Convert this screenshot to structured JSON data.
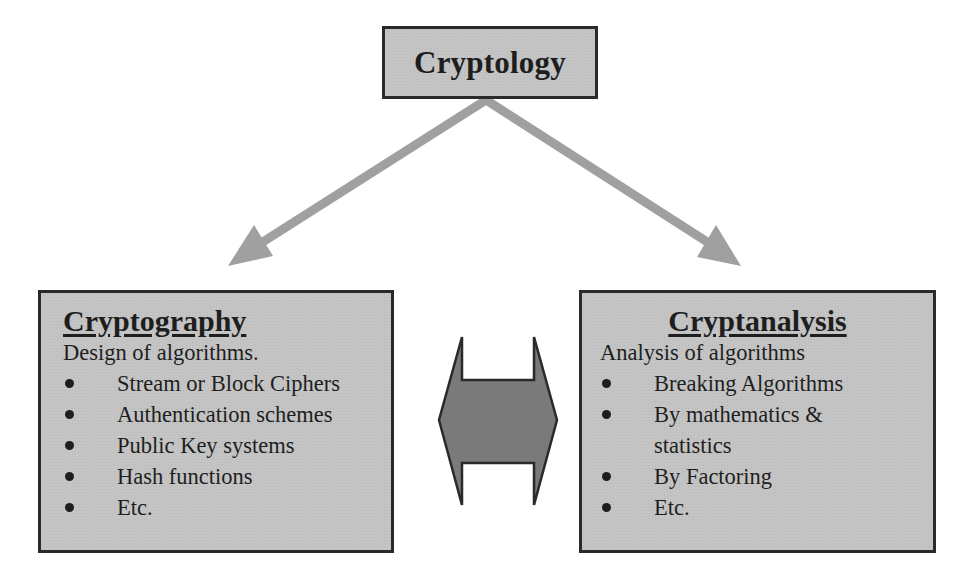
{
  "diagram": {
    "root": {
      "label": "Cryptology"
    },
    "left": {
      "heading": "Cryptography",
      "subtitle": "Design of algorithms.",
      "items": [
        {
          "label": "Stream or Block Ciphers"
        },
        {
          "label": "Authentication schemes"
        },
        {
          "label": "Public Key systems"
        },
        {
          "label": "Hash functions"
        },
        {
          "label": "Etc."
        }
      ]
    },
    "right": {
      "heading": "Cryptanalysis",
      "subtitle": "Analysis of algorithms",
      "items": [
        {
          "label": "Breaking Algorithms"
        },
        {
          "label": "By mathematics &",
          "continuation": "statistics"
        },
        {
          "label": "By Factoring"
        },
        {
          "label": "Etc."
        }
      ]
    },
    "edges": [
      {
        "from": "Cryptology",
        "to": "Cryptography",
        "type": "arrow"
      },
      {
        "from": "Cryptology",
        "to": "Cryptanalysis",
        "type": "arrow"
      },
      {
        "from": "Cryptography",
        "to": "Cryptanalysis",
        "type": "double-arrow"
      }
    ],
    "colors": {
      "box_fill": "#c4c4c4",
      "box_border": "#2a2a2a",
      "arrow_fill": "#a0a0a0",
      "double_arrow_fill": "#7a7a7a",
      "text": "#1e1e1e"
    }
  }
}
